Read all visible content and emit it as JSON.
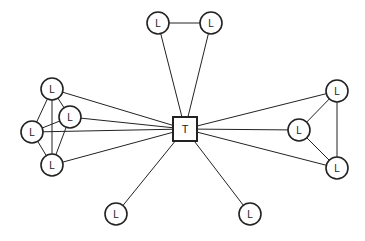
{
  "diagram": {
    "type": "network",
    "hub": {
      "id": "T",
      "label": "T",
      "shape": "square",
      "x": 185,
      "y": 129,
      "size": 24
    },
    "nodes": [
      {
        "id": "n1",
        "label": "L",
        "x": 158,
        "y": 23
      },
      {
        "id": "n2",
        "label": "L",
        "x": 211,
        "y": 23
      },
      {
        "id": "n3",
        "label": "L",
        "x": 52,
        "y": 89
      },
      {
        "id": "n4",
        "label": "L",
        "x": 70,
        "y": 117
      },
      {
        "id": "n5",
        "label": "L",
        "x": 32,
        "y": 132
      },
      {
        "id": "n6",
        "label": "L",
        "x": 52,
        "y": 165
      },
      {
        "id": "n7",
        "label": "L",
        "x": 337,
        "y": 91
      },
      {
        "id": "n8",
        "label": "L",
        "x": 299,
        "y": 130
      },
      {
        "id": "n9",
        "label": "L",
        "x": 337,
        "y": 168
      },
      {
        "id": "n10",
        "label": "L",
        "x": 116,
        "y": 214
      },
      {
        "id": "n11",
        "label": "L",
        "x": 250,
        "y": 214
      }
    ],
    "edges": [
      [
        "n1",
        "n2"
      ],
      [
        "n1",
        "T"
      ],
      [
        "n2",
        "T"
      ],
      [
        "n3",
        "T"
      ],
      [
        "n4",
        "T"
      ],
      [
        "n5",
        "T"
      ],
      [
        "n6",
        "T"
      ],
      [
        "n3",
        "n5"
      ],
      [
        "n3",
        "n6"
      ],
      [
        "n3",
        "n4"
      ],
      [
        "n5",
        "n4"
      ],
      [
        "n5",
        "n6"
      ],
      [
        "n4",
        "n6"
      ],
      [
        "n7",
        "T"
      ],
      [
        "n8",
        "T"
      ],
      [
        "n9",
        "T"
      ],
      [
        "n7",
        "n8"
      ],
      [
        "n7",
        "n9"
      ],
      [
        "n8",
        "n9"
      ],
      [
        "n10",
        "T"
      ],
      [
        "n11",
        "T"
      ]
    ],
    "node_radius": 11,
    "stroke_color": "#222222"
  }
}
